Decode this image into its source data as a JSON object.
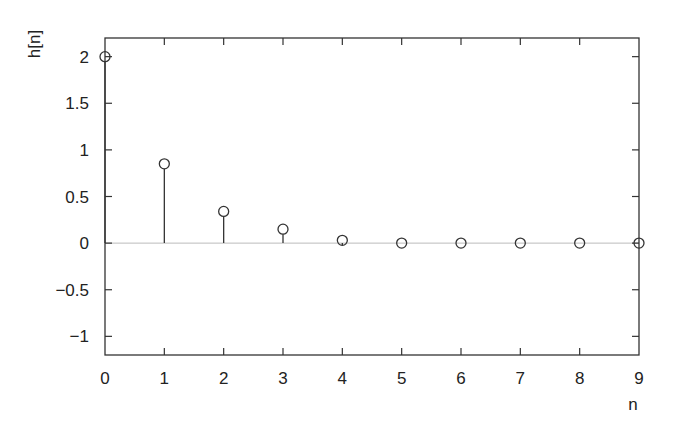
{
  "chart_data": {
    "type": "stem",
    "title": "",
    "xlabel": "n",
    "ylabel": "h[n]",
    "x": [
      0,
      1,
      2,
      3,
      4,
      5,
      6,
      7,
      8,
      9
    ],
    "values": [
      2.0,
      0.85,
      0.34,
      0.15,
      0.03,
      0.0,
      0.0,
      0.0,
      0.0,
      0.0
    ],
    "xlim": [
      0,
      9
    ],
    "ylim": [
      -1.2,
      2.2
    ],
    "xticks": [
      0,
      1,
      2,
      3,
      4,
      5,
      6,
      7,
      8,
      9
    ],
    "xtick_labels": [
      "0",
      "1",
      "2",
      "3",
      "4",
      "5",
      "6",
      "7",
      "8",
      "9"
    ],
    "yticks": [
      2,
      1.5,
      1,
      0.5,
      0,
      -0.5,
      -1
    ],
    "ytick_labels": [
      "2",
      "1.5",
      "1",
      "0.5",
      "0",
      "−0.5",
      "−1"
    ],
    "grid": false,
    "legend": null,
    "zero_line": true,
    "marker": "open-circle",
    "colors": {
      "line": "#333333",
      "zero_line": "#bbbbbb",
      "axes": "#333333"
    }
  }
}
